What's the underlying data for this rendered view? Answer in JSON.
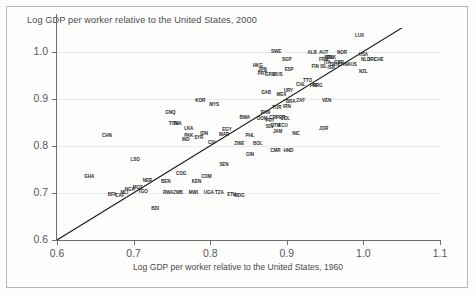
{
  "chart_data": {
    "type": "scatter",
    "title": "Log GDP per worker relative to the United States, 2000",
    "xlabel": "Log GDP per worker relative to the United States, 1960",
    "ylabel": "",
    "xlim": [
      0.6,
      1.1
    ],
    "ylim": [
      0.6,
      1.05
    ],
    "xticks": [
      "0.6",
      "0.7",
      "0.8",
      "0.9",
      "1.0",
      "1.1"
    ],
    "xtick_values": [
      0.6,
      0.7,
      0.8,
      0.9,
      1.0,
      1.1
    ],
    "yticks": [
      "0.6",
      "0.7",
      "0.8",
      "0.9",
      "1.0"
    ],
    "ytick_values": [
      0.6,
      0.7,
      0.8,
      0.9,
      1.0
    ],
    "grid": "horizontal",
    "legend": "none",
    "marker_style": "text-label",
    "reference_line": {
      "name": "45-degree-line",
      "x0": 0.6,
      "y0": 0.6,
      "x1": 1.055,
      "y1": 1.055
    },
    "points": [
      {
        "label": "LUX",
        "x": 0.995,
        "y": 1.035
      },
      {
        "label": "USA",
        "x": 1.0,
        "y": 0.995
      },
      {
        "label": "NOR",
        "x": 0.972,
        "y": 1.0
      },
      {
        "label": "ALB",
        "x": 0.933,
        "y": 1.0
      },
      {
        "label": "AUT",
        "x": 0.948,
        "y": 1.0
      },
      {
        "label": "SWE",
        "x": 0.886,
        "y": 1.002
      },
      {
        "label": "BEL",
        "x": 0.955,
        "y": 0.988
      },
      {
        "label": "DNK",
        "x": 0.958,
        "y": 0.988
      },
      {
        "label": "FRA",
        "x": 0.948,
        "y": 0.985
      },
      {
        "label": "NLD",
        "x": 1.003,
        "y": 0.985
      },
      {
        "label": "IRL",
        "x": 1.012,
        "y": 0.985
      },
      {
        "label": "CHE",
        "x": 1.02,
        "y": 0.985
      },
      {
        "label": "ITA",
        "x": 0.953,
        "y": 0.978
      },
      {
        "label": "GBR",
        "x": 0.968,
        "y": 0.978
      },
      {
        "label": "DEU",
        "x": 0.962,
        "y": 0.973
      },
      {
        "label": "FIN",
        "x": 0.937,
        "y": 0.97
      },
      {
        "label": "ISL",
        "x": 0.948,
        "y": 0.97
      },
      {
        "label": "CAN",
        "x": 0.973,
        "y": 0.973
      },
      {
        "label": "AUS",
        "x": 0.985,
        "y": 0.973
      },
      {
        "label": "ISR",
        "x": 0.958,
        "y": 0.968
      },
      {
        "label": "NZL",
        "x": 1.0,
        "y": 0.958
      },
      {
        "label": "HKG",
        "x": 0.862,
        "y": 0.972
      },
      {
        "label": "JPN",
        "x": 0.868,
        "y": 0.962
      },
      {
        "label": "SGP",
        "x": 0.9,
        "y": 0.985
      },
      {
        "label": "ESP",
        "x": 0.903,
        "y": 0.962
      },
      {
        "label": "MUS",
        "x": 0.888,
        "y": 0.952
      },
      {
        "label": "PRT",
        "x": 0.868,
        "y": 0.955
      },
      {
        "label": "GRC",
        "x": 0.878,
        "y": 0.952
      },
      {
        "label": "TTO",
        "x": 0.927,
        "y": 0.94
      },
      {
        "label": "CHL",
        "x": 0.918,
        "y": 0.932
      },
      {
        "label": "PRI",
        "x": 0.935,
        "y": 0.928
      },
      {
        "label": "ARG",
        "x": 0.94,
        "y": 0.928
      },
      {
        "label": "URY",
        "x": 0.902,
        "y": 0.918
      },
      {
        "label": "GAB",
        "x": 0.873,
        "y": 0.915
      },
      {
        "label": "MEX",
        "x": 0.893,
        "y": 0.91
      },
      {
        "label": "VEN",
        "x": 0.952,
        "y": 0.898
      },
      {
        "label": "ZAF",
        "x": 0.918,
        "y": 0.898
      },
      {
        "label": "BRA",
        "x": 0.905,
        "y": 0.895
      },
      {
        "label": "IRN",
        "x": 0.9,
        "y": 0.885
      },
      {
        "label": "TUR",
        "x": 0.887,
        "y": 0.882
      },
      {
        "label": "KOR",
        "x": 0.787,
        "y": 0.898
      },
      {
        "label": "MYS",
        "x": 0.805,
        "y": 0.888
      },
      {
        "label": "PAN",
        "x": 0.872,
        "y": 0.872
      },
      {
        "label": "CRI",
        "x": 0.882,
        "y": 0.862
      },
      {
        "label": "PER",
        "x": 0.892,
        "y": 0.862
      },
      {
        "label": "COL",
        "x": 0.898,
        "y": 0.858
      },
      {
        "label": "PRY",
        "x": 0.878,
        "y": 0.855
      },
      {
        "label": "DOM",
        "x": 0.868,
        "y": 0.858
      },
      {
        "label": "BWA",
        "x": 0.845,
        "y": 0.862
      },
      {
        "label": "GNQ",
        "x": 0.748,
        "y": 0.872
      },
      {
        "label": "JOR",
        "x": 0.948,
        "y": 0.838
      },
      {
        "label": "NIC",
        "x": 0.912,
        "y": 0.828
      },
      {
        "label": "GTM",
        "x": 0.885,
        "y": 0.845
      },
      {
        "label": "ECU",
        "x": 0.895,
        "y": 0.845
      },
      {
        "label": "SLV",
        "x": 0.878,
        "y": 0.842
      },
      {
        "label": "JAM",
        "x": 0.888,
        "y": 0.832
      },
      {
        "label": "THA",
        "x": 0.757,
        "y": 0.848
      },
      {
        "label": "TUN",
        "x": 0.752,
        "y": 0.848
      },
      {
        "label": "LKA",
        "x": 0.772,
        "y": 0.838
      },
      {
        "label": "IDN",
        "x": 0.792,
        "y": 0.828
      },
      {
        "label": "EGY",
        "x": 0.822,
        "y": 0.835
      },
      {
        "label": "MAR",
        "x": 0.818,
        "y": 0.825
      },
      {
        "label": "PHL",
        "x": 0.852,
        "y": 0.822
      },
      {
        "label": "SYR",
        "x": 0.785,
        "y": 0.818
      },
      {
        "label": "PAK",
        "x": 0.772,
        "y": 0.822
      },
      {
        "label": "IND",
        "x": 0.768,
        "y": 0.815
      },
      {
        "label": "CHN",
        "x": 0.665,
        "y": 0.822
      },
      {
        "label": "CIV",
        "x": 0.802,
        "y": 0.808
      },
      {
        "label": "ZWE",
        "x": 0.838,
        "y": 0.805
      },
      {
        "label": "BOL",
        "x": 0.862,
        "y": 0.805
      },
      {
        "label": "CMR",
        "x": 0.885,
        "y": 0.792
      },
      {
        "label": "HND",
        "x": 0.902,
        "y": 0.792
      },
      {
        "label": "LSO",
        "x": 0.702,
        "y": 0.772
      },
      {
        "label": "GIN",
        "x": 0.852,
        "y": 0.782
      },
      {
        "label": "SEN",
        "x": 0.818,
        "y": 0.762
      },
      {
        "label": "GHA",
        "x": 0.642,
        "y": 0.735
      },
      {
        "label": "COG",
        "x": 0.762,
        "y": 0.742
      },
      {
        "label": "COM",
        "x": 0.795,
        "y": 0.735
      },
      {
        "label": "NER",
        "x": 0.718,
        "y": 0.728
      },
      {
        "label": "BEN",
        "x": 0.742,
        "y": 0.725
      },
      {
        "label": "KEN",
        "x": 0.782,
        "y": 0.725
      },
      {
        "label": "MOZ",
        "x": 0.705,
        "y": 0.712
      },
      {
        "label": "NGA",
        "x": 0.695,
        "y": 0.708
      },
      {
        "label": "TGO",
        "x": 0.712,
        "y": 0.705
      },
      {
        "label": "MLI",
        "x": 0.688,
        "y": 0.702
      },
      {
        "label": "RWA",
        "x": 0.745,
        "y": 0.702
      },
      {
        "label": "ZMB",
        "x": 0.758,
        "y": 0.702
      },
      {
        "label": "MWI",
        "x": 0.778,
        "y": 0.702
      },
      {
        "label": "UGA",
        "x": 0.798,
        "y": 0.702
      },
      {
        "label": "TZA",
        "x": 0.812,
        "y": 0.702
      },
      {
        "label": "ETH",
        "x": 0.828,
        "y": 0.698
      },
      {
        "label": "MDG",
        "x": 0.838,
        "y": 0.695
      },
      {
        "label": "BFA",
        "x": 0.672,
        "y": 0.698
      },
      {
        "label": "CAF",
        "x": 0.682,
        "y": 0.695
      },
      {
        "label": "BDI",
        "x": 0.728,
        "y": 0.668
      }
    ]
  }
}
